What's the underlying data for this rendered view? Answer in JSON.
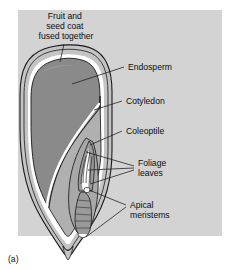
{
  "figure": {
    "caption": "(a)",
    "panel_color": "#d3d3d3",
    "page_background": "#ffffff",
    "outline_color": "#1a1a1a",
    "endosperm_color": "#8a8a8a",
    "cotyledon_color": "#b0b0b0",
    "coat_color": "#c4c4c4",
    "highlight_color": "#ffffff"
  },
  "labels": {
    "fruit_seed_coat": {
      "line1": "Fruit and",
      "line2": "seed coat",
      "line3": "fused together"
    },
    "endosperm": "Endosperm",
    "cotyledon": "Cotyledon",
    "coleoptile": "Coleoptile",
    "foliage_leaves": {
      "line1": "Foliage",
      "line2": "leaves"
    },
    "apical_meristems": {
      "line1": "Apical",
      "line2": "meristems"
    }
  }
}
